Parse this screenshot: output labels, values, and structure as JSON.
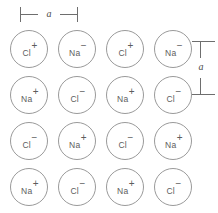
{
  "figure": {
    "stroke_color": "#9a9a9a",
    "text_color": "#5d5d5d",
    "dimension_color": "#6e6e6e",
    "background_color": "#ffffff"
  },
  "dimensions": {
    "horizontal": {
      "label": "a",
      "orientation": "horizontal",
      "position": "top-left"
    },
    "vertical": {
      "label": "a",
      "orientation": "vertical",
      "position": "right"
    }
  },
  "lattice": {
    "rows": 4,
    "columns": 4,
    "column_centers_px": [
      29,
      77,
      125,
      173
    ],
    "row_centers_px": [
      49,
      95,
      141,
      187
    ],
    "ion_diameter_px": 38,
    "ions": [
      [
        {
          "symbol": "Cl",
          "charge": "+"
        },
        {
          "symbol": "Na",
          "charge": "−"
        },
        {
          "symbol": "Cl",
          "charge": "+"
        },
        {
          "symbol": "Na",
          "charge": "−"
        }
      ],
      [
        {
          "symbol": "Na",
          "charge": "+"
        },
        {
          "symbol": "Cl",
          "charge": "−"
        },
        {
          "symbol": "Na",
          "charge": "+"
        },
        {
          "symbol": "Cl",
          "charge": "−"
        }
      ],
      [
        {
          "symbol": "Cl",
          "charge": "−"
        },
        {
          "symbol": "Na",
          "charge": "+"
        },
        {
          "symbol": "Cl",
          "charge": "−"
        },
        {
          "symbol": "Na",
          "charge": "+"
        }
      ],
      [
        {
          "symbol": "Na",
          "charge": "+"
        },
        {
          "symbol": "Cl",
          "charge": "−"
        },
        {
          "symbol": "Na",
          "charge": "+"
        },
        {
          "symbol": "Cl",
          "charge": "−"
        }
      ]
    ]
  }
}
